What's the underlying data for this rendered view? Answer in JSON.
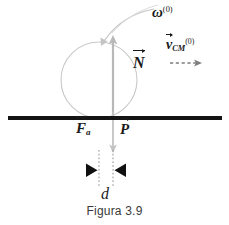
{
  "figure": {
    "caption": "Figura 3.9",
    "labels": {
      "omega": "ω",
      "omega_superscript": "(0)",
      "v_cm": "v",
      "v_cm_subscript": "CM",
      "v_cm_superscript": "(0)",
      "normal_force": "N",
      "friction_force": "F",
      "friction_subscript": "a",
      "weight": "P",
      "distance": "d"
    }
  },
  "colors": {
    "ground": "#141414",
    "ball_outline": "#c9c9c9",
    "force_arrow": "#b8b8b8",
    "spin_arc": "#c4c4c4",
    "velocity_arrow": "#7d7d7d",
    "marker": "#101010",
    "dotted_line": "#8c8c8c",
    "text": "#1a1a1a",
    "caption_text": "#3a3a3a",
    "background": "#ffffff"
  },
  "geometry": {
    "ball_center_x": 99,
    "ball_center_y": 80,
    "ball_radius": 38,
    "ground_y": 118,
    "ground_x_start": 8,
    "ground_x_end": 222,
    "normal_arrow_x": 113,
    "normal_arrow_top_y": 36,
    "weight_arrow_bottom_y": 152,
    "dim_left_x": 99,
    "dim_right_x": 113,
    "dim_marker_y": 170
  }
}
